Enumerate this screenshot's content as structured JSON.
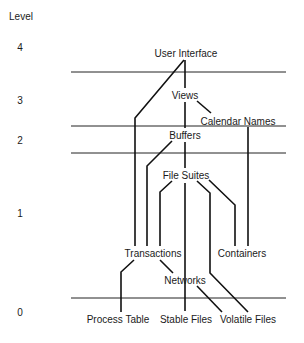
{
  "diagram": {
    "axis_title": "Level",
    "levels": [
      {
        "label": "4",
        "x": 20,
        "y": 42
      },
      {
        "label": "3",
        "x": 20,
        "y": 95
      },
      {
        "label": "2",
        "x": 20,
        "y": 135
      },
      {
        "label": "1",
        "x": 20,
        "y": 208
      },
      {
        "label": "0",
        "x": 20,
        "y": 307
      }
    ],
    "separators": [
      {
        "y": 72,
        "x1": 71,
        "x2": 286
      },
      {
        "y": 126,
        "x1": 71,
        "x2": 286
      },
      {
        "y": 153,
        "x1": 71,
        "x2": 286
      },
      {
        "y": 298,
        "x1": 71,
        "x2": 286
      }
    ],
    "nodes": [
      {
        "id": "user-interface",
        "label": "User Interface",
        "x": 186,
        "y": 48
      },
      {
        "id": "views",
        "label": "Views",
        "x": 185,
        "y": 90
      },
      {
        "id": "calendar-names",
        "label": "Calendar Names",
        "x": 238,
        "y": 116
      },
      {
        "id": "buffers",
        "label": "Buffers",
        "x": 185,
        "y": 130
      },
      {
        "id": "file-suites",
        "label": "File Suites",
        "x": 186,
        "y": 170
      },
      {
        "id": "transactions",
        "label": "Transactions",
        "x": 153,
        "y": 248
      },
      {
        "id": "containers",
        "label": "Containers",
        "x": 242,
        "y": 248
      },
      {
        "id": "networks",
        "label": "Networks",
        "x": 185,
        "y": 275
      },
      {
        "id": "process-table",
        "label": "Process Table",
        "x": 118,
        "y": 314
      },
      {
        "id": "stable-files",
        "label": "Stable Files",
        "x": 186,
        "y": 314
      },
      {
        "id": "volatile-files",
        "label": "Volatile Files",
        "x": 248,
        "y": 314
      }
    ],
    "edges": [
      {
        "from": "user-interface",
        "to": "transactions",
        "points": "184,60 135,118 135,246"
      },
      {
        "from": "user-interface",
        "to": "views",
        "points": "185,60 185,88"
      },
      {
        "from": "views",
        "to": "buffers",
        "points": "185,102 185,128"
      },
      {
        "from": "views",
        "to": "calendar-names",
        "points": "197,101 211,113"
      },
      {
        "from": "calendar-names",
        "to": "containers",
        "points": "248,127 248,246"
      },
      {
        "from": "buffers",
        "to": "transactions",
        "points": "172,141 147,166 147,246"
      },
      {
        "from": "buffers",
        "to": "file-suites",
        "points": "185,142 185,168"
      },
      {
        "from": "file-suites",
        "to": "transactions",
        "points": "172,181 160,192 160,246"
      },
      {
        "from": "file-suites",
        "to": "stable-files",
        "points": "185,183 185,311"
      },
      {
        "from": "file-suites",
        "to": "volatile-files",
        "points": "197,181 210,193 210,273 248,312"
      },
      {
        "from": "file-suites",
        "to": "containers",
        "points": "209,180 235,205 235,246"
      },
      {
        "from": "transactions",
        "to": "process-table",
        "points": "134,260 121,272 121,312"
      },
      {
        "from": "transactions",
        "to": "networks",
        "points": "160,260 173,273"
      },
      {
        "from": "networks",
        "to": "volatile-files",
        "points": "197,286 222,312"
      }
    ]
  }
}
